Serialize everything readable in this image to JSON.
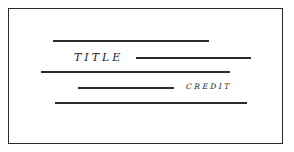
{
  "diagram": {
    "title_label": "TITLE",
    "credit_label": "CREDIT",
    "stroke_color": "#2a2a2a",
    "background": "#ffffff",
    "lines": [
      {
        "x1": 53,
        "x2": 209,
        "y": 40
      },
      {
        "x1": 136,
        "x2": 251,
        "y": 57
      },
      {
        "x1": 41,
        "x2": 230,
        "y": 71
      },
      {
        "x1": 78,
        "x2": 174,
        "y": 87
      },
      {
        "x1": 55,
        "x2": 247,
        "y": 102
      }
    ]
  }
}
